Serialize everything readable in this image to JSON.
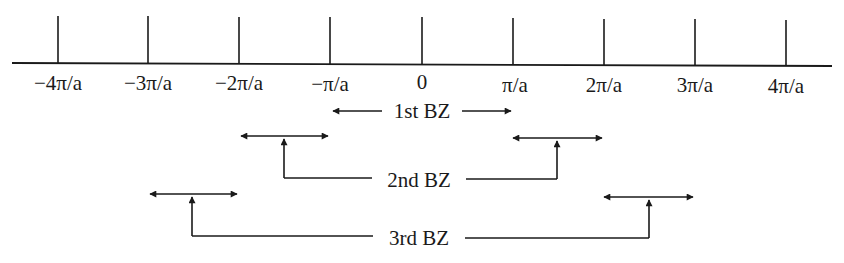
{
  "diagram": {
    "axis": {
      "ticks": [
        {
          "label": "−4π/a",
          "x": 58
        },
        {
          "label": "−3π/a",
          "x": 148
        },
        {
          "label": "−2π/a",
          "x": 239
        },
        {
          "label": "−π/a",
          "x": 330
        },
        {
          "label": "0",
          "x": 422
        },
        {
          "label": "π/a",
          "x": 513
        },
        {
          "label": "2π/a",
          "x": 604
        },
        {
          "label": "3π/a",
          "x": 695
        },
        {
          "label": "4π/a",
          "x": 786
        }
      ]
    },
    "zones": [
      {
        "label": "1st BZ",
        "ranges": [
          [
            -1,
            1
          ]
        ]
      },
      {
        "label": "2nd BZ",
        "ranges": [
          [
            -2,
            -1
          ],
          [
            1,
            2
          ]
        ]
      },
      {
        "label": "3rd BZ",
        "ranges": [
          [
            -3,
            -2
          ],
          [
            2,
            3
          ]
        ]
      }
    ],
    "colors": {
      "ink": "#1a1a1a",
      "background": "#ffffff"
    }
  }
}
